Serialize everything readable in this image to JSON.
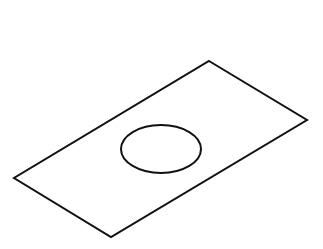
{
  "figure": {
    "stroke_color": "#111111",
    "background": "#ffffff",
    "plate": {
      "corners": [
        [
          209,
          61
        ],
        [
          307,
          120
        ],
        [
          111,
          237
        ],
        [
          14,
          178
        ]
      ]
    },
    "hole": {
      "cx": 161,
      "cy": 149,
      "rx": 40,
      "ry": 24
    }
  }
}
